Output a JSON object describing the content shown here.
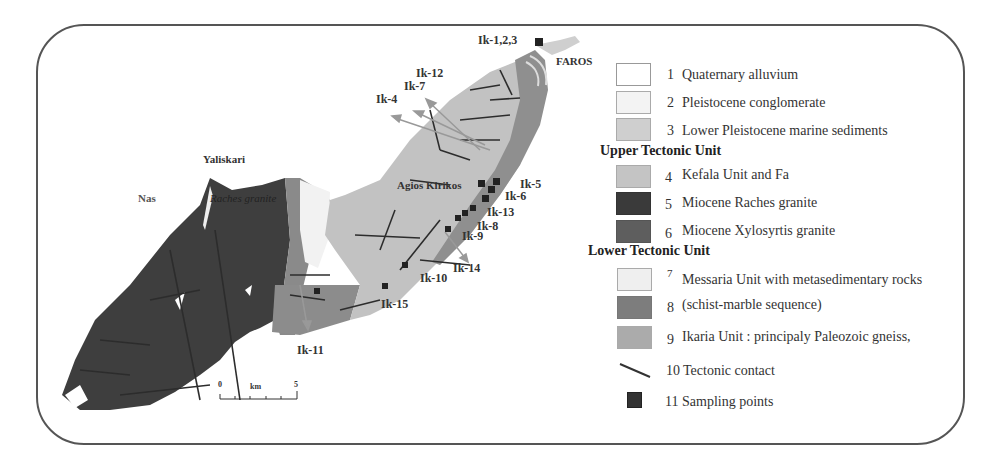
{
  "map": {
    "places": {
      "faros": "FAROS",
      "yaliskari": "Yaliskari",
      "nas": "Nas",
      "agios_kirikos": "Agios Kirikos",
      "raches_granite": "Raches granite"
    },
    "samples": {
      "ik_1_2_3": "Ik-1,2,3",
      "ik_12": "Ik-12",
      "ik_7": "Ik-7",
      "ik_4": "Ik-4",
      "ik_5": "Ik-5",
      "ik_6": "Ik-6",
      "ik_13": "Ik-13",
      "ik_8": "Ik-8",
      "ik_9": "Ik-9",
      "ik_14": "Ik-14",
      "ik_10": "Ik-10",
      "ik_15": "Ik-15",
      "ik_11": "Ik-11"
    },
    "scale": {
      "start": "0",
      "unit": "km",
      "end": "5"
    }
  },
  "legend": {
    "groups": {
      "upper": "Upper Tectonic Unit",
      "lower": "Lower Tectonic Unit"
    },
    "items": [
      {
        "num": "1",
        "label": "Quaternary alluvium",
        "color": "#ffffff"
      },
      {
        "num": "2",
        "label": "Pleistocene conglomerate",
        "color": "#f3f3f3"
      },
      {
        "num": "3",
        "label": "Lower Pleistocene marine sediments",
        "color": "#cfcfcf"
      },
      {
        "num": "4",
        "label": "Kefala Unit and Fa",
        "color": "#c4c4c4"
      },
      {
        "num": "5",
        "label": "Miocene Raches granite",
        "color": "#3a3a3a"
      },
      {
        "num": "6",
        "label": "Miocene Xylosyrtis granite",
        "color": "#5e5e5e"
      },
      {
        "num": "7",
        "label": "Messaria Unit with metasedimentary rocks",
        "color": "#efefef"
      },
      {
        "num": "8",
        "label": "(schist-marble sequence)",
        "color": "#7d7d7d"
      },
      {
        "num": "9",
        "label": "Ikaria Unit : principaly Paleozoic gneiss,",
        "color": "#ababab"
      },
      {
        "num": "10",
        "label": "Tectonic contact",
        "color": "#444444"
      },
      {
        "num": "11",
        "label": "Sampling points",
        "color": "#333333"
      }
    ]
  }
}
